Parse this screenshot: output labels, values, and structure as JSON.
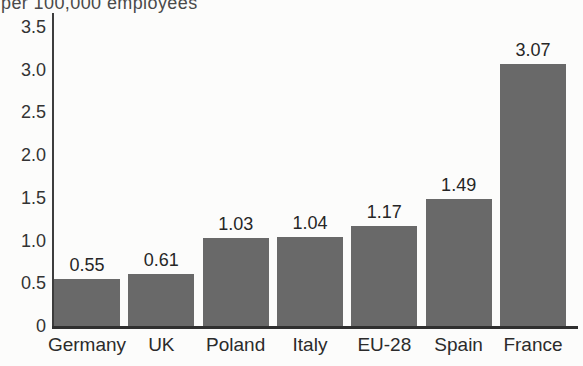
{
  "chart_data": {
    "type": "bar",
    "title": "per 100,000 employees",
    "xlabel": "",
    "ylabel": "per 100,000 employees",
    "categories": [
      "Germany",
      "UK",
      "Poland",
      "Italy",
      "EU-28",
      "Spain",
      "France"
    ],
    "values": [
      0.55,
      0.61,
      1.03,
      1.04,
      1.17,
      1.49,
      3.07
    ],
    "value_labels": [
      "0.55",
      "0.61",
      "1.03",
      "1.04",
      "1.17",
      "1.49",
      "3.07"
    ],
    "ylim": [
      0,
      3.5
    ],
    "yticks": [
      0,
      0.5,
      1.0,
      1.5,
      2.0,
      2.5,
      3.0,
      3.5
    ],
    "ytick_labels": [
      "0",
      "0.5",
      "1.0",
      "1.5",
      "2.0",
      "2.5",
      "3.0",
      "3.5"
    ],
    "grid": false,
    "legend": null,
    "colors": {
      "bar": "#696969",
      "axis": "#3d3d3d",
      "text": "#2b2b2b",
      "background": "#fcfcfb"
    }
  }
}
